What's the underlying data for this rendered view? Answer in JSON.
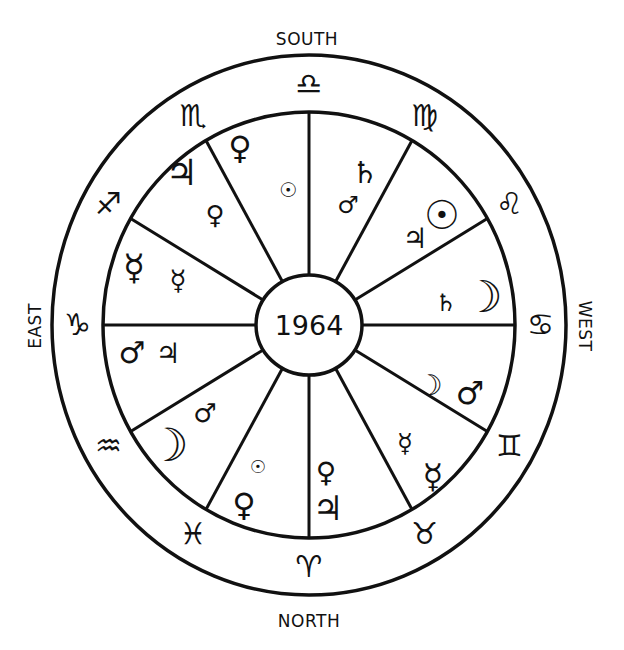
{
  "center": {
    "year": "1964"
  },
  "directions": {
    "south": "SOUTH",
    "north": "NORTH",
    "east": "EAST",
    "west": "WEST"
  },
  "colors": {
    "ink": "#111111",
    "paper": "#ffffff"
  },
  "geometry": {
    "cx": 309,
    "cy": 325,
    "outer_rx": 257,
    "outer_ry": 270,
    "inner_rx": 206,
    "inner_ry": 213,
    "hub_rx": 53,
    "hub_ry": 50
  },
  "signs": [
    {
      "name": "Libra",
      "glyph": "♎",
      "position": "south",
      "angle": 90
    },
    {
      "name": "Virgo",
      "glyph": "♍",
      "position": "south-west-upper",
      "angle": 60
    },
    {
      "name": "Leo",
      "glyph": "♌",
      "position": "west-upper",
      "angle": 30
    },
    {
      "name": "Cancer",
      "glyph": "♋",
      "position": "west",
      "angle": 0
    },
    {
      "name": "Gemini",
      "glyph": "♊",
      "position": "west-lower",
      "angle": -30
    },
    {
      "name": "Taurus",
      "glyph": "♉",
      "position": "north-west-lower",
      "angle": -60
    },
    {
      "name": "Aries",
      "glyph": "♈",
      "position": "north",
      "angle": -90
    },
    {
      "name": "Pisces",
      "glyph": "♓",
      "position": "north-east-lower",
      "angle": -120
    },
    {
      "name": "Aquarius",
      "glyph": "♒",
      "position": "east-lower",
      "angle": -150
    },
    {
      "name": "Capricorn",
      "glyph": "♑",
      "position": "east",
      "angle": 180
    },
    {
      "name": "Sagittarius",
      "glyph": "♐",
      "position": "east-upper",
      "angle": 150
    },
    {
      "name": "Scorpio",
      "glyph": "♏",
      "position": "south-east-upper",
      "angle": 120
    }
  ],
  "houses": [
    {
      "sector": "top-left (90-120)",
      "planets": [
        {
          "name": "Venus",
          "glyph": "♀",
          "x": 240,
          "y": 148,
          "size": 32
        },
        {
          "name": "Sun",
          "glyph": "☉",
          "x": 288,
          "y": 190,
          "size": 20
        }
      ]
    },
    {
      "sector": "upper-left (120-150)",
      "planets": [
        {
          "name": "Jupiter",
          "glyph": "♃",
          "x": 182,
          "y": 172,
          "size": 36
        },
        {
          "name": "Venus",
          "glyph": "♀",
          "x": 215,
          "y": 215,
          "size": 26
        }
      ]
    },
    {
      "sector": "left-upper (150-180)",
      "planets": [
        {
          "name": "Mercury",
          "glyph": "☿",
          "x": 134,
          "y": 267,
          "size": 36
        },
        {
          "name": "Mercury",
          "glyph": "☿",
          "x": 178,
          "y": 280,
          "size": 28
        }
      ]
    },
    {
      "sector": "left-lower (180-210)",
      "planets": [
        {
          "name": "Mars",
          "glyph": "♂",
          "x": 132,
          "y": 352,
          "size": 30
        },
        {
          "name": "Jupiter",
          "glyph": "♃",
          "x": 168,
          "y": 353,
          "size": 28
        }
      ]
    },
    {
      "sector": "lower-left (210-240)",
      "planets": [
        {
          "name": "Moon",
          "glyph": "☽",
          "x": 168,
          "y": 445,
          "size": 46
        },
        {
          "name": "Mars",
          "glyph": "♂",
          "x": 205,
          "y": 413,
          "size": 26
        }
      ]
    },
    {
      "sector": "bottom-left (240-270)",
      "planets": [
        {
          "name": "Sun",
          "glyph": "☉",
          "x": 258,
          "y": 467,
          "size": 18
        },
        {
          "name": "Venus",
          "glyph": "♀",
          "x": 244,
          "y": 505,
          "size": 32
        }
      ]
    },
    {
      "sector": "bottom-right (270-300)",
      "planets": [
        {
          "name": "Venus",
          "glyph": "♀",
          "x": 326,
          "y": 472,
          "size": 28
        },
        {
          "name": "Jupiter",
          "glyph": "♃",
          "x": 328,
          "y": 508,
          "size": 34
        }
      ]
    },
    {
      "sector": "lower-right (300-330)",
      "planets": [
        {
          "name": "Mercury",
          "glyph": "☿",
          "x": 405,
          "y": 443,
          "size": 26
        },
        {
          "name": "Mercury",
          "glyph": "☿",
          "x": 433,
          "y": 476,
          "size": 34
        }
      ]
    },
    {
      "sector": "right-lower (330-360)",
      "planets": [
        {
          "name": "Moon",
          "glyph": "☽",
          "x": 430,
          "y": 385,
          "size": 28
        },
        {
          "name": "Mars",
          "glyph": "♂",
          "x": 470,
          "y": 393,
          "size": 32
        }
      ]
    },
    {
      "sector": "right-upper (0-30)",
      "planets": [
        {
          "name": "Saturn",
          "glyph": "♄",
          "x": 446,
          "y": 303,
          "size": 24
        },
        {
          "name": "Moon",
          "glyph": "☽",
          "x": 483,
          "y": 297,
          "size": 44
        }
      ]
    },
    {
      "sector": "upper-right (30-60)",
      "planets": [
        {
          "name": "Jupiter",
          "glyph": "♃",
          "x": 415,
          "y": 238,
          "size": 28
        },
        {
          "name": "Sun",
          "glyph": "☉",
          "x": 442,
          "y": 215,
          "size": 40
        }
      ]
    },
    {
      "sector": "top-right (60-90)",
      "planets": [
        {
          "name": "Saturn",
          "glyph": "♄",
          "x": 365,
          "y": 172,
          "size": 30
        },
        {
          "name": "Mars",
          "glyph": "♂",
          "x": 348,
          "y": 205,
          "size": 24
        }
      ]
    }
  ]
}
